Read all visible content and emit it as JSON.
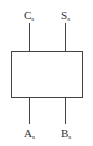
{
  "diagram": {
    "block": {
      "label": ""
    },
    "outputs": [
      {
        "name": "C",
        "subscript": "n"
      },
      {
        "name": "S",
        "subscript": "n"
      }
    ],
    "inputs": [
      {
        "name": "A",
        "subscript": "n"
      },
      {
        "name": "B",
        "subscript": "n"
      }
    ],
    "colors": {
      "line": "#444444",
      "text": "#333333",
      "background": "#ffffff"
    }
  }
}
